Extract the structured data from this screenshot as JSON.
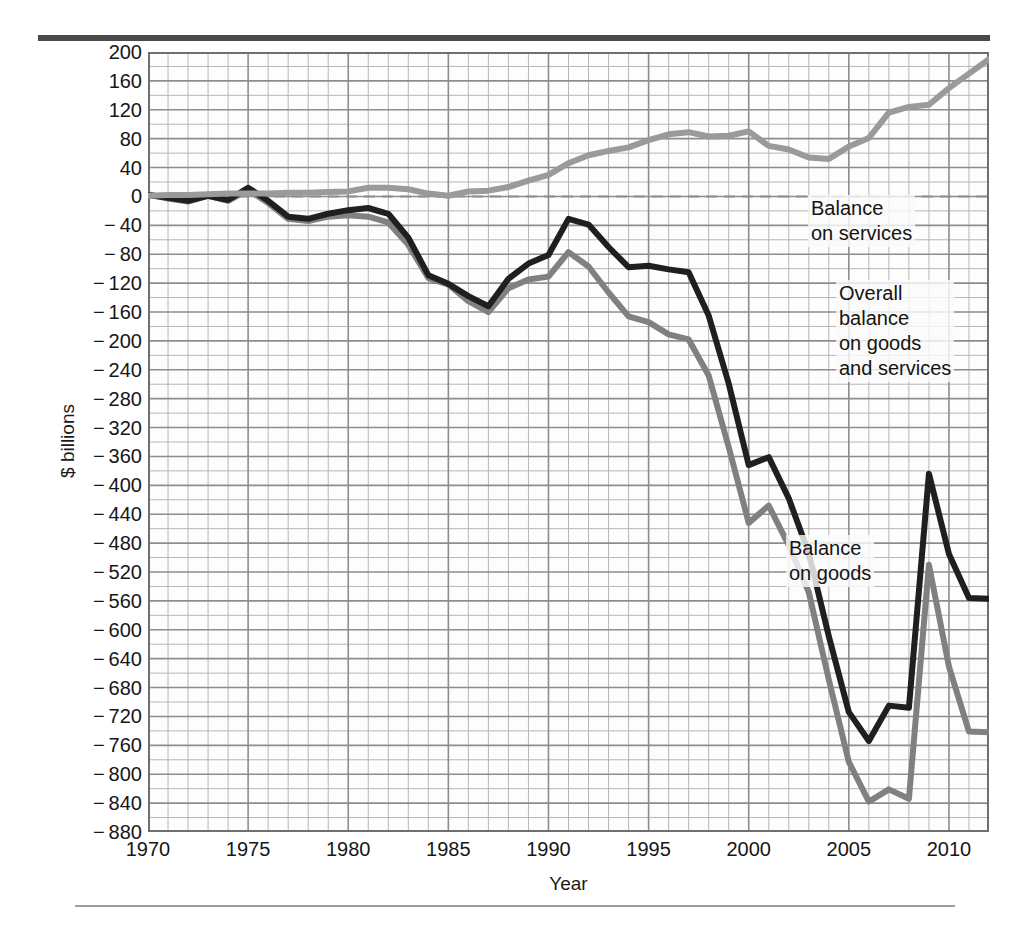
{
  "chart_data": {
    "type": "line",
    "title": "",
    "subtitle": "",
    "xlabel": "Year",
    "ylabel": "$ billions",
    "xlim": [
      1970,
      2012
    ],
    "ylim": [
      -880,
      200
    ],
    "grid": true,
    "grid_y_step": 20,
    "grid_x_step": 1,
    "legend_position": "inline-annotations",
    "zero_line": true,
    "yticks": [
      200,
      160,
      120,
      80,
      40,
      0,
      -40,
      -80,
      -120,
      -160,
      -200,
      -240,
      -280,
      -320,
      -360,
      -400,
      -440,
      -480,
      -520,
      -560,
      -600,
      -640,
      -680,
      -720,
      -760,
      -800,
      -840,
      -880
    ],
    "ytick_labels": [
      "200",
      "160",
      "120",
      "80",
      "40",
      "0",
      "− 40",
      "− 80",
      "− 120",
      "− 160",
      "− 200",
      "− 240",
      "− 280",
      "− 320",
      "− 360",
      "− 400",
      "− 440",
      "− 480",
      "− 520",
      "− 560",
      "− 600",
      "− 640",
      "− 680",
      "− 720",
      "− 760",
      "− 800",
      "− 840",
      "− 880"
    ],
    "xticks": [
      1970,
      1975,
      1980,
      1985,
      1990,
      1995,
      2000,
      2005,
      2010
    ],
    "xtick_labels": [
      "1970",
      "1975",
      "1980",
      "1985",
      "1990",
      "1995",
      "2000",
      "2005",
      "2010"
    ],
    "x": [
      1970,
      1971,
      1972,
      1973,
      1974,
      1975,
      1976,
      1977,
      1978,
      1979,
      1980,
      1981,
      1982,
      1983,
      1984,
      1985,
      1986,
      1987,
      1988,
      1989,
      1990,
      1991,
      1992,
      1993,
      1994,
      1995,
      1996,
      1997,
      1998,
      1999,
      2000,
      2001,
      2002,
      2003,
      2004,
      2005,
      2006,
      2007,
      2008,
      2009,
      2010,
      2011,
      2012
    ],
    "series": [
      {
        "name": "Balance on goods",
        "color": "#808080",
        "values": [
          3,
          -3,
          -7,
          1,
          -6,
          9,
          -9,
          -31,
          -34,
          -28,
          -26,
          -28,
          -36,
          -67,
          -113,
          -122,
          -145,
          -160,
          -127,
          -115,
          -111,
          -77,
          -97,
          -133,
          -166,
          -174,
          -191,
          -198,
          -248,
          -347,
          -452,
          -428,
          -483,
          -548,
          -669,
          -783,
          -838,
          -821,
          -834,
          -510,
          -651,
          -741,
          -742
        ]
      },
      {
        "name": "Overall balance on goods and services",
        "color": "#1f1f1f",
        "values": [
          2,
          -2,
          -6,
          1,
          -5,
          12,
          -6,
          -28,
          -31,
          -24,
          -19,
          -16,
          -24,
          -57,
          -109,
          -121,
          -138,
          -152,
          -114,
          -93,
          -81,
          -31,
          -39,
          -70,
          -98,
          -96,
          -101,
          -105,
          -165,
          -259,
          -372,
          -361,
          -418,
          -494,
          -609,
          -714,
          -754,
          -705,
          -708,
          -384,
          -495,
          -556,
          -557
        ]
      },
      {
        "name": "Balance on services",
        "color": "#9a9a9a",
        "values": [
          1,
          2,
          2,
          3,
          4,
          4,
          4,
          5,
          5,
          6,
          7,
          12,
          12,
          10,
          4,
          1,
          7,
          8,
          13,
          22,
          30,
          46,
          57,
          63,
          68,
          78,
          86,
          89,
          83,
          84,
          90,
          70,
          65,
          54,
          52,
          69,
          81,
          116,
          124,
          127,
          150,
          170,
          190
        ]
      }
    ],
    "annotations": [
      {
        "name": "balance-on-services",
        "text": "Balance\non services"
      },
      {
        "name": "overall-balance",
        "text": "Overall\nbalance\non goods\nand services"
      },
      {
        "name": "balance-on-goods",
        "text": "Balance\non goods"
      }
    ]
  },
  "style": {
    "grid_minor_color": "#b6b6b6",
    "grid_major_color": "#8d8d8d",
    "zero_line_color": "#8d8d8d",
    "frame_color": "#6f6f6f",
    "rule_top_color": "#4a4a4a",
    "rule_bottom_color": "#9d9d9d",
    "plot_bg": "#fdfdfd"
  }
}
